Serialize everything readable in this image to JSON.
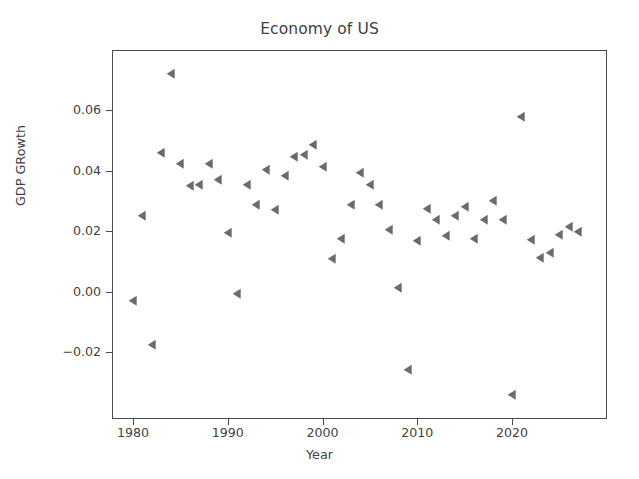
{
  "chart_data": {
    "type": "scatter",
    "title": "Economy of US",
    "xlabel": "Year",
    "ylabel": "GDP GRowth",
    "marker": "triangle-left",
    "marker_color": "#6b6b6b",
    "grid": false,
    "legend": null,
    "xlim": [
      1978.4,
      1978.4
    ],
    "ylim": [
      -0.0386,
      0.08
    ],
    "xticks": [
      1980,
      1990,
      2000,
      2010,
      2020
    ],
    "xtick_labels": [
      "1980",
      "1990",
      "2000",
      "2010",
      "2020"
    ],
    "yticks": [
      -0.02,
      0.0,
      0.02,
      0.04,
      0.06
    ],
    "ytick_labels": [
      "−0.02",
      "0.00",
      "0.02",
      "0.04",
      "0.06"
    ],
    "x": [
      1980,
      1981,
      1982,
      1983,
      1984,
      1985,
      1986,
      1987,
      1988,
      1989,
      1990,
      1991,
      1992,
      1993,
      1994,
      1995,
      1996,
      1997,
      1998,
      1999,
      2000,
      2001,
      2002,
      2003,
      2004,
      2005,
      2006,
      2007,
      2008,
      2009,
      2010,
      2011,
      2012,
      2013,
      2014,
      2015,
      2016,
      2017,
      2018,
      2019,
      2020,
      2021,
      2022,
      2023,
      2024,
      2025,
      2026,
      2027
    ],
    "y": [
      -0.003,
      0.0251,
      -0.0178,
      0.0459,
      0.0718,
      0.0421,
      0.035,
      0.0351,
      0.0422,
      0.037,
      0.0193,
      -0.0009,
      0.0352,
      0.0285,
      0.0402,
      0.027,
      0.0382,
      0.0444,
      0.045,
      0.0485,
      0.041,
      0.0107,
      0.0174,
      0.0285,
      0.0391,
      0.0353,
      0.0285,
      0.0204,
      0.0013,
      -0.0259,
      0.0167,
      0.0274,
      0.0236,
      0.0184,
      0.0251,
      0.028,
      0.0173,
      0.0236,
      0.0299,
      0.0236,
      -0.0342,
      0.0578,
      0.017,
      0.0112,
      0.0126,
      0.0186,
      0.0213,
      0.0198
    ],
    "n_points": 48
  },
  "axes": {
    "x_pixel_per_year": 9.475,
    "x_origin_year": 1980,
    "x_origin_px": 133,
    "y_value_at_ref": 0.06,
    "y_ref_px": 110,
    "y_pixel_per_unit": 3025
  }
}
